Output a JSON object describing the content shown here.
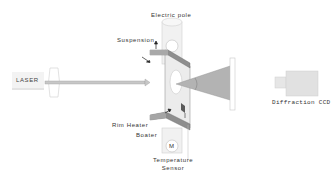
{
  "diagram": {
    "type": "experimental-setup",
    "components": {
      "laser": {
        "label": "LASER"
      },
      "electric_pole": {
        "label": "Electric pole"
      },
      "suspension": {
        "label": "Suspension"
      },
      "rim_heater": {
        "label": "Rim Heater"
      },
      "boat_heater": {
        "label": "Boater"
      },
      "motor": {
        "label": "M"
      },
      "temperature_sensor": {
        "line1": "Temperature",
        "line2": "Sensor"
      },
      "diffraction_ccd": {
        "label": "Diffraction CCD"
      }
    },
    "colors": {
      "line": "#555555",
      "fill_light": "#e8e8e8",
      "fill_mid": "#bdbdbd",
      "fill_dark": "#8a8a8a",
      "beam": "#b5b5b5"
    }
  }
}
